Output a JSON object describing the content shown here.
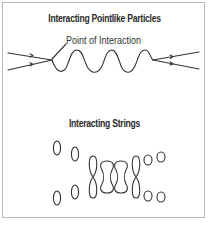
{
  "diagram": {
    "panel_top": {
      "title": "Interacting Pointlike Particles",
      "callout_label": "Point of Interaction",
      "elements": {
        "incoming_lines": 2,
        "outgoing_lines": 2,
        "exchange_wave": "wavy propagator between two interaction points"
      }
    },
    "panel_bottom": {
      "title": "Interacting Strings",
      "elements": {
        "closed_string_loops_left": 4,
        "joining_shapes": [
          "figure-eight",
          "peanut",
          "peanut",
          "figure-eight"
        ],
        "closed_string_loops_right": 4
      }
    },
    "colors": {
      "line": "#333333",
      "border": "#b8b8b8",
      "background": "#ffffff"
    }
  }
}
